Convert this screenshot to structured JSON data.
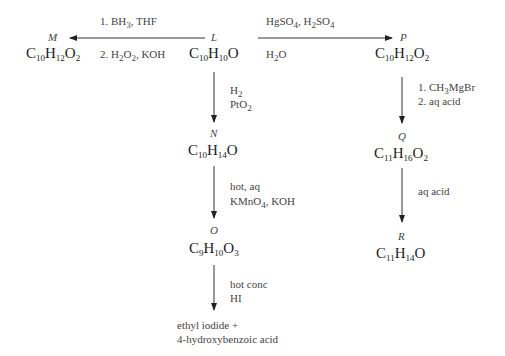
{
  "compounds": {
    "L": {
      "label": "L",
      "formula": [
        "C",
        "10",
        "H",
        "10",
        "O",
        ""
      ]
    },
    "M": {
      "label": "M",
      "formula": [
        "C",
        "10",
        "H",
        "12",
        "O",
        "2"
      ]
    },
    "N": {
      "label": "N",
      "formula": [
        "C",
        "10",
        "H",
        "14",
        "O",
        ""
      ]
    },
    "O": {
      "label": "O",
      "formula": [
        "C",
        "9",
        "H",
        "10",
        "O",
        "3"
      ]
    },
    "P": {
      "label": "P",
      "formula": [
        "C",
        "10",
        "H",
        "12",
        "O",
        "2"
      ]
    },
    "Q": {
      "label": "Q",
      "formula": [
        "C",
        "11",
        "H",
        "16",
        "O",
        "2"
      ]
    },
    "R": {
      "label": "R",
      "formula": [
        "C",
        "11",
        "H",
        "14",
        "O",
        ""
      ]
    }
  },
  "reactions": {
    "L_to_M": {
      "line1": "1. BH",
      "line1_sub": "3",
      "line1_tail": ", THF",
      "line2_a": "2. H",
      "line2_sub1": "2",
      "line2_b": "O",
      "line2_sub2": "2",
      "line2_c": ", KOH"
    },
    "L_to_P": {
      "line1_a": "HgSO",
      "line1_sub1": "4",
      "line1_b": ", H",
      "line1_sub2": "2",
      "line1_c": "SO",
      "line1_sub3": "4",
      "line2_a": "H",
      "line2_sub": "2",
      "line2_b": "O"
    },
    "L_to_N": {
      "line1_a": "H",
      "line1_sub": "2",
      "line2_a": "PtO",
      "line2_sub": "2"
    },
    "N_to_O": {
      "line1": "hot, aq",
      "line2_a": "KMnO",
      "line2_sub": "4",
      "line2_b": ", KOH"
    },
    "O_to_products": {
      "line1": "hot conc",
      "line2": "HI"
    },
    "P_to_Q": {
      "line1_a": "1.  CH",
      "line1_sub": "3",
      "line1_b": "MgBr",
      "line2": "2.  aq acid"
    },
    "Q_to_R": {
      "line1": "aq acid"
    }
  },
  "final_products": {
    "line1": "ethyl iodide +",
    "line2": "4-hydroxybenzoic acid"
  }
}
